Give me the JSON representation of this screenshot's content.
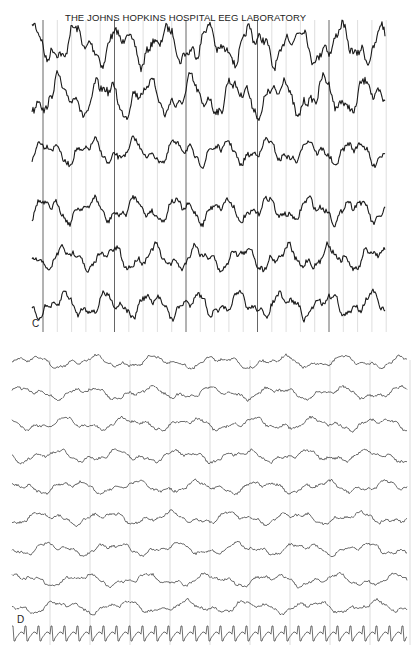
{
  "figure": {
    "title": "THE JOHNS HOPKINS HOSPITAL EEG LABORATORY",
    "panels": [
      {
        "label": "C",
        "channels": 6,
        "trace_color": "#1a1a1a",
        "grid_color": "#bdbdbd",
        "grid_strong_color": "#555555"
      },
      {
        "label": "D",
        "channels": 10,
        "trace_color": "#4a4a4a",
        "grid_color": "#c4c4c4"
      }
    ]
  }
}
